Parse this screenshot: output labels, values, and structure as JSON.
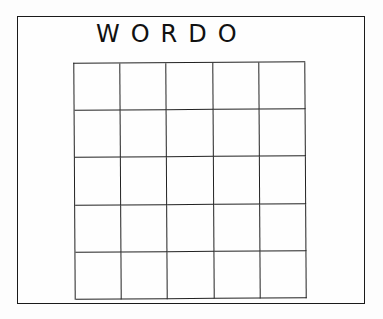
{
  "title": "WORDO",
  "grid": {
    "rows": 5,
    "columns": 5,
    "cells": [
      [
        "",
        "",
        "",
        "",
        ""
      ],
      [
        "",
        "",
        "",
        "",
        ""
      ],
      [
        "",
        "",
        "",
        "",
        ""
      ],
      [
        "",
        "",
        "",
        "",
        ""
      ],
      [
        "",
        "",
        "",
        "",
        ""
      ]
    ]
  },
  "colors": {
    "ink": "#111111",
    "paper": "#fefefe"
  }
}
